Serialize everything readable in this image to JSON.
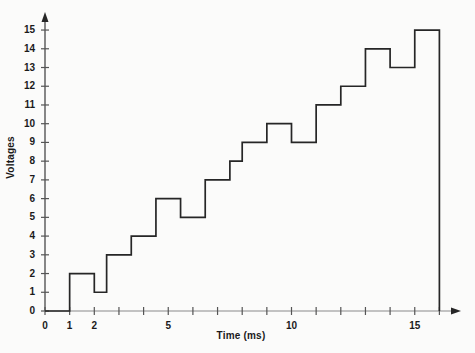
{
  "chart_data": {
    "type": "line",
    "subtype": "step",
    "title": "",
    "xlabel": "Time (ms)",
    "ylabel": "Voltages",
    "xlim": [
      0,
      16.6
    ],
    "ylim": [
      0,
      15.8
    ],
    "grid": false,
    "legend": "none",
    "xticks": [
      0,
      1,
      2,
      3,
      4,
      5,
      6,
      7,
      8,
      9,
      10,
      11,
      12,
      13,
      14,
      15,
      16
    ],
    "xtick_labels": [
      "0",
      "1",
      "2",
      "",
      "",
      "5",
      "",
      "",
      "",
      "",
      "10",
      "",
      "",
      "",
      "",
      "15",
      ""
    ],
    "yticks": [
      0,
      1,
      2,
      3,
      4,
      5,
      6,
      7,
      8,
      9,
      10,
      11,
      12,
      13,
      14,
      15
    ],
    "ytick_labels": [
      "0",
      "1",
      "2",
      "3",
      "4",
      "5",
      "6",
      "7",
      "8",
      "9",
      "10",
      "11",
      "12",
      "13",
      "14",
      "15"
    ],
    "steps": [
      {
        "x_start": 0.0,
        "x_end": 1.0,
        "value": 0
      },
      {
        "x_start": 1.0,
        "x_end": 2.0,
        "value": 2
      },
      {
        "x_start": 2.0,
        "x_end": 2.5,
        "value": 1
      },
      {
        "x_start": 2.5,
        "x_end": 3.5,
        "value": 3
      },
      {
        "x_start": 3.5,
        "x_end": 4.5,
        "value": 4
      },
      {
        "x_start": 4.5,
        "x_end": 5.5,
        "value": 6
      },
      {
        "x_start": 5.5,
        "x_end": 6.5,
        "value": 5
      },
      {
        "x_start": 6.5,
        "x_end": 7.5,
        "value": 7
      },
      {
        "x_start": 7.5,
        "x_end": 8.0,
        "value": 8
      },
      {
        "x_start": 8.0,
        "x_end": 9.0,
        "value": 9
      },
      {
        "x_start": 9.0,
        "x_end": 10.0,
        "value": 10
      },
      {
        "x_start": 10.0,
        "x_end": 11.0,
        "value": 9
      },
      {
        "x_start": 11.0,
        "x_end": 12.0,
        "value": 11
      },
      {
        "x_start": 12.0,
        "x_end": 13.0,
        "value": 12
      },
      {
        "x_start": 13.0,
        "x_end": 14.0,
        "value": 14
      },
      {
        "x_start": 14.0,
        "x_end": 15.0,
        "value": 13
      },
      {
        "x_start": 15.0,
        "x_end": 16.0,
        "value": 15
      }
    ],
    "x": [
      0,
      1,
      2,
      2.5,
      3.5,
      4.5,
      5.5,
      6.5,
      7.5,
      8,
      9,
      10,
      11,
      12,
      13,
      14,
      15,
      16
    ],
    "values": [
      0,
      2,
      1,
      3,
      4,
      6,
      5,
      7,
      8,
      9,
      10,
      9,
      11,
      12,
      14,
      13,
      15,
      0
    ],
    "line_color": "#262626",
    "axis_color": "#555555",
    "background": "#fbfbfa"
  }
}
